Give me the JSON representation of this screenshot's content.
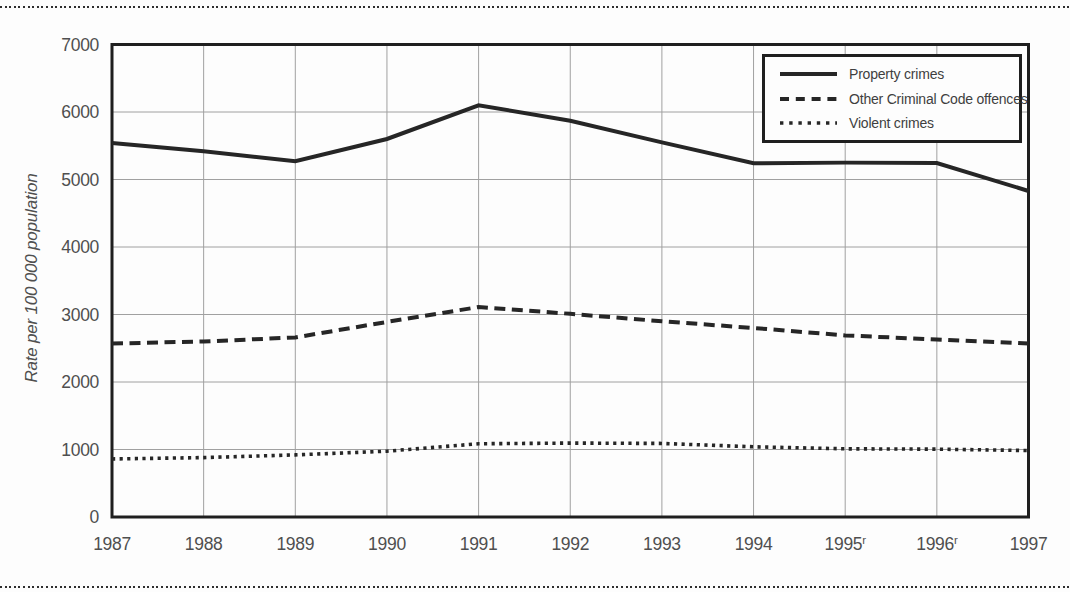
{
  "figure": {
    "top_rule_style": "dotted",
    "bottom_rule_style": "dotted",
    "background": "#fdfdfd",
    "line_color": "#262626",
    "grid_color": "#a0a0a0",
    "border_color": "#1f1f1f",
    "text_color": "#4f4f4f"
  },
  "chart_data": {
    "type": "line",
    "title": "",
    "xlabel": "",
    "ylabel": "Rate per 100 000 population",
    "categories": [
      "1987",
      "1988",
      "1989",
      "1990",
      "1991",
      "1992",
      "1993",
      "1994",
      "1995",
      "1996",
      "1997"
    ],
    "category_superscripts": [
      "",
      "",
      "",
      "",
      "",
      "",
      "",
      "",
      "r",
      "r",
      ""
    ],
    "ylim": [
      0,
      7000
    ],
    "ytick_step": 1000,
    "grid": true,
    "legend_position": "top-right-inside",
    "series": [
      {
        "name": "Property crimes",
        "line_style": "solid",
        "values": [
          5540,
          5420,
          5270,
          5600,
          6100,
          5870,
          5550,
          5240,
          5250,
          5245,
          4830
        ]
      },
      {
        "name": "Other Criminal Code offences",
        "line_style": "dashed",
        "values": [
          2570,
          2600,
          2660,
          2890,
          3110,
          3010,
          2900,
          2800,
          2690,
          2630,
          2570
        ]
      },
      {
        "name": "Violent crimes",
        "line_style": "dotted",
        "values": [
          860,
          880,
          920,
          975,
          1085,
          1095,
          1090,
          1040,
          1010,
          1005,
          985
        ]
      }
    ]
  }
}
